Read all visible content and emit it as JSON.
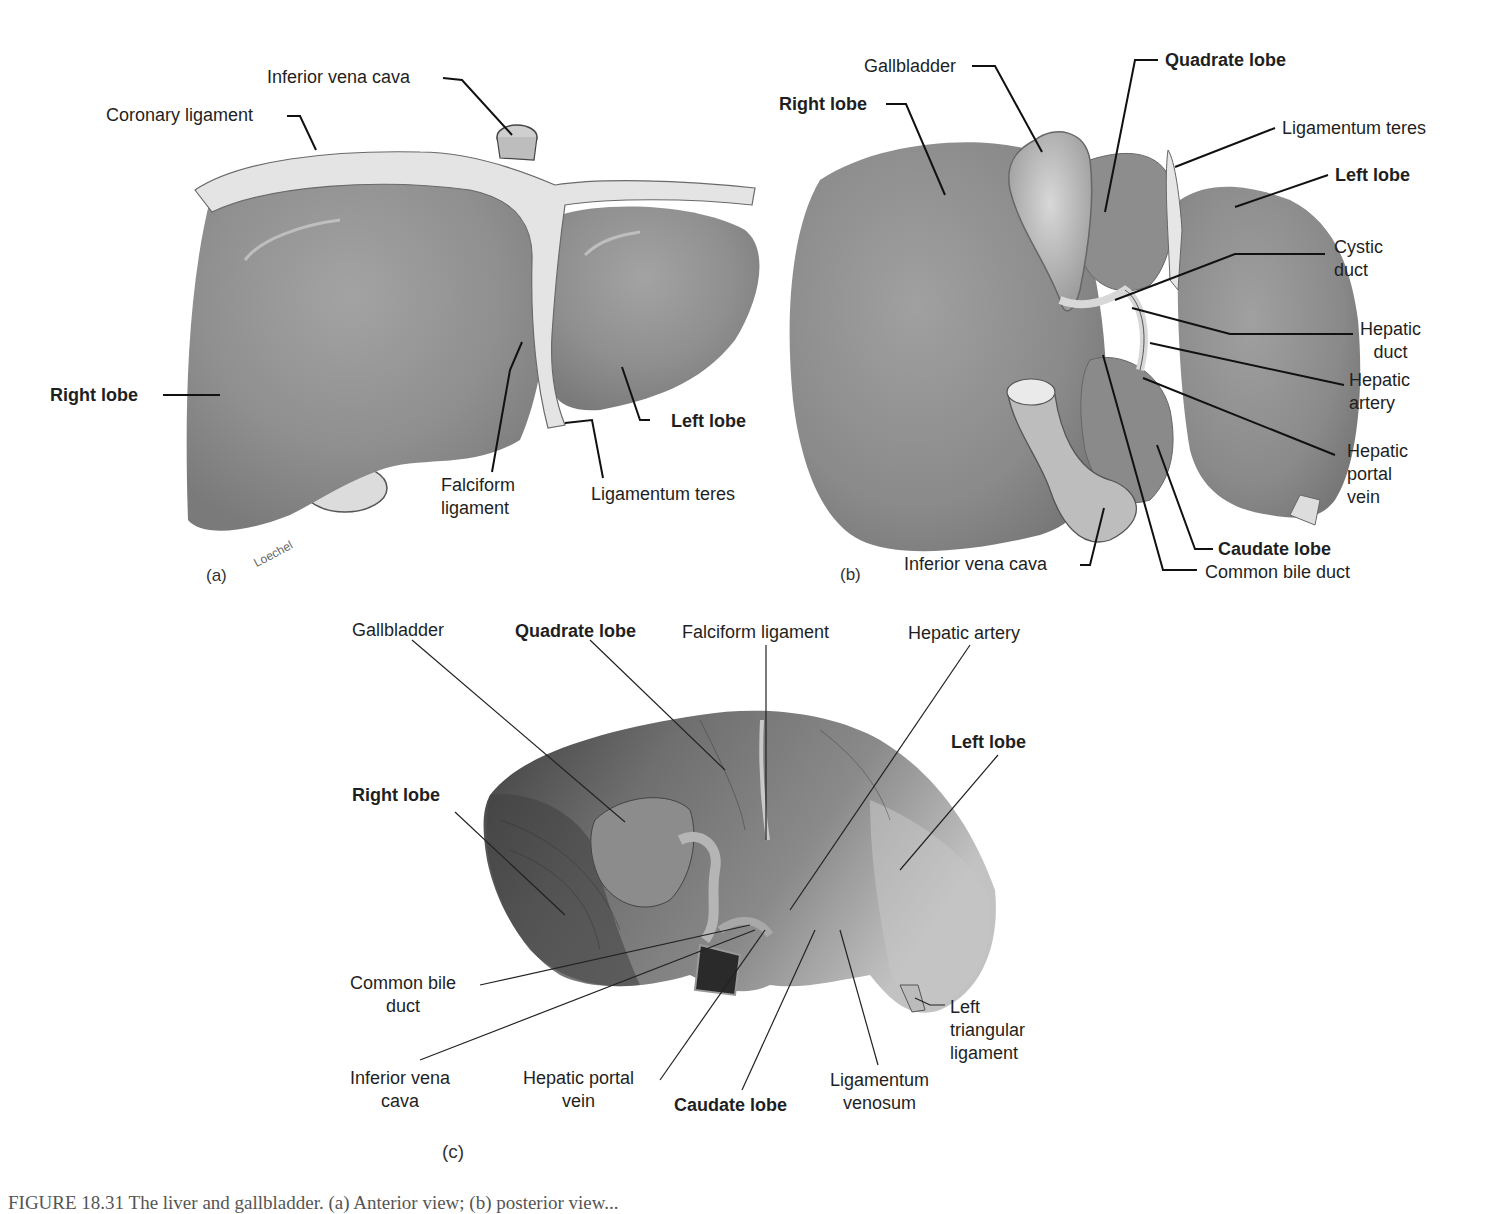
{
  "figure": {
    "caption_visible_fragment": "FIGURE 18.31  The liver and gallbladder. (a) Anterior view; (b) posterior view...",
    "colors": {
      "liver_drawing": "#8e8e8e",
      "liver_highlight": "#a6a6a6",
      "ligament": "#e6e6e6",
      "photo_dark": "#4a4a4a",
      "photo_mid": "#7d7d7d",
      "leader_line": "#111111",
      "background": "#ffffff"
    }
  },
  "panel_a": {
    "tag": "(a)",
    "signature": "Loechel",
    "labels": {
      "inferior_vena_cava": "Inferior vena cava",
      "coronary_ligament": "Coronary ligament",
      "right_lobe": "Right lobe",
      "left_lobe": "Left lobe",
      "falciform_ligament": "Falciform\nligament",
      "ligamentum_teres": "Ligamentum teres"
    }
  },
  "panel_b": {
    "tag": "(b)",
    "labels": {
      "gallbladder": "Gallbladder",
      "quadrate_lobe": "Quadrate lobe",
      "right_lobe": "Right lobe",
      "ligamentum_teres": "Ligamentum teres",
      "left_lobe": "Left lobe",
      "cystic_duct": "Cystic\nduct",
      "hepatic_duct": "Hepatic\nduct",
      "hepatic_artery": "Hepatic\nartery",
      "hepatic_portal_vein": "Hepatic\nportal\nvein",
      "caudate_lobe": "Caudate lobe",
      "common_bile_duct": "Common bile duct",
      "inferior_vena_cava": "Inferior vena cava"
    }
  },
  "panel_c": {
    "tag": "(c)",
    "labels": {
      "gallbladder": "Gallbladder",
      "quadrate_lobe": "Quadrate lobe",
      "falciform_ligament": "Falciform ligament",
      "hepatic_artery": "Hepatic artery",
      "left_lobe": "Left lobe",
      "right_lobe": "Right lobe",
      "common_bile_duct": "Common bile\nduct",
      "inferior_vena_cava": "Inferior vena\ncava",
      "hepatic_portal_vein": "Hepatic portal\nvein",
      "caudate_lobe": "Caudate lobe",
      "ligamentum_venosum": "Ligamentum\nvenosum",
      "left_triangular_ligament": "Left\ntriangular\nligament"
    }
  }
}
